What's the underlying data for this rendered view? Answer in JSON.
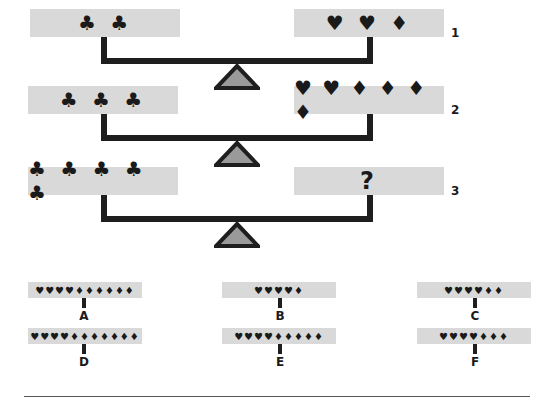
{
  "puzzle": {
    "type": "balance-scale symbol equivalence puzzle",
    "scales": [
      {
        "number": "1",
        "left": "♣ ♣",
        "right": "♥ ♥ ♦"
      },
      {
        "number": "2",
        "left": "♣ ♣ ♣",
        "right": "♥ ♥ ♦ ♦ ♦ ♦"
      },
      {
        "number": "3",
        "left": "♣ ♣ ♣ ♣ ♣",
        "right": "?"
      }
    ],
    "options": [
      {
        "label": "A",
        "symbols": "♥♥♥♥♦♦♦♦♦♦",
        "hearts": 4,
        "diamonds": 6
      },
      {
        "label": "B",
        "symbols": "♥♥♥♥♦",
        "hearts": 4,
        "diamonds": 1
      },
      {
        "label": "C",
        "symbols": "♥♥♥♥♦♦",
        "hearts": 4,
        "diamonds": 2
      },
      {
        "label": "D",
        "symbols": "♥♥♥♥♦♦♦♦♦♦♦",
        "hearts": 4,
        "diamonds": 7
      },
      {
        "label": "E",
        "symbols": "♥♥♥♥♦♦♦♦♦",
        "hearts": 4,
        "diamonds": 5
      },
      {
        "label": "F",
        "symbols": "♥♥♥♥♦♦♦",
        "hearts": 4,
        "diamonds": 3
      }
    ]
  },
  "colors": {
    "pan_fill": "#d9d9d9",
    "beam": "#1e1e1e",
    "fulcrum_fill": "#9a9a9a"
  }
}
